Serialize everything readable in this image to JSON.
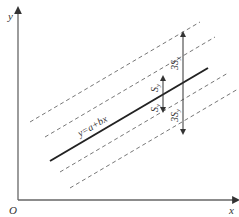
{
  "diagram": {
    "axes": {
      "y_label": "y",
      "x_label": "x",
      "origin_label": "O",
      "color": "#666666"
    },
    "regression_line": {
      "equation": "y=a+bx",
      "color": "#222222"
    },
    "bands": {
      "inner_label": "S",
      "inner_subscript": "y",
      "outer_label": "3S",
      "outer_subscript": "y",
      "dash_color": "#777777"
    },
    "arrows": {
      "inner_top_label": "S",
      "inner_bottom_label": "S",
      "outer_top_label": "3S",
      "outer_bottom_label": "3S",
      "subscript": "y"
    }
  }
}
